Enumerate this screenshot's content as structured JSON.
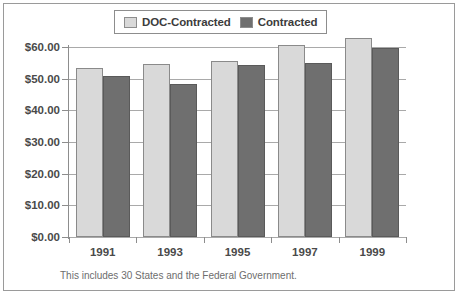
{
  "chart_data": {
    "type": "bar",
    "title": "",
    "subtitle": "",
    "xlabel": "",
    "ylabel": "",
    "categories": [
      "1991",
      "1993",
      "1995",
      "1997",
      "1999"
    ],
    "series": [
      {
        "name": "DOC-Contracted",
        "color": "#d9d9d9",
        "values": [
          53.3,
          54.6,
          55.6,
          60.6,
          62.7
        ]
      },
      {
        "name": "Contracted",
        "color": "#6f6f6f",
        "values": [
          50.8,
          48.4,
          54.4,
          55.0,
          59.6
        ]
      }
    ],
    "ylim": [
      0,
      60
    ],
    "ytick_values": [
      0,
      10,
      20,
      30,
      40,
      50,
      60
    ],
    "ytick_labels": [
      "$0.00",
      "$10.00",
      "$20.00",
      "$30.00",
      "$40.00",
      "$50.00",
      "$60.00"
    ],
    "grid": true,
    "legend_position": "top-center",
    "annotations": [
      "This includes 30 States and the Federal Government."
    ]
  },
  "legend": {
    "entries": [
      {
        "label": "DOC-Contracted",
        "color": "#d9d9d9"
      },
      {
        "label": "Contracted",
        "color": "#6f6f6f"
      }
    ]
  },
  "footnote": {
    "text": "This includes 30 States and the Federal Government."
  }
}
